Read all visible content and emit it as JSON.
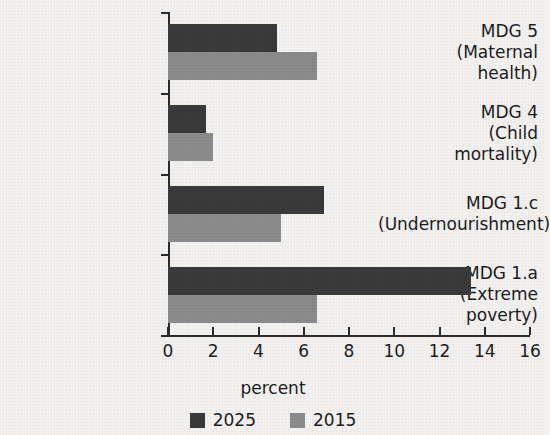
{
  "chart_data": {
    "type": "bar",
    "orientation": "horizontal",
    "title": "",
    "xlabel": "percent",
    "ylabel": "",
    "xlim": [
      0,
      16
    ],
    "xticks": [
      0,
      2,
      4,
      6,
      8,
      10,
      12,
      14,
      16
    ],
    "xtick_labels": [
      "0",
      "2",
      "4",
      "6",
      "8",
      "10",
      "12",
      "14",
      "16"
    ],
    "grid": false,
    "legend_position": "bottom",
    "categories": [
      "MDG 5\n(Maternal\nhealth)",
      "MDG 4\n(Child\nmortality)",
      "MDG 1.c\n(Undernourishment)",
      "MDG 1.a\n(Extreme\npoverty)"
    ],
    "category_lines": [
      [
        "MDG 5",
        "(Maternal",
        "health)"
      ],
      [
        "MDG 4",
        "(Child",
        "mortality)"
      ],
      [
        "MDG 1.c",
        "(Undernourishment)"
      ],
      [
        "MDG 1.a",
        "(Extreme",
        "poverty)"
      ]
    ],
    "series": [
      {
        "name": "2025",
        "color": "#3a3a3a",
        "values": [
          4.8,
          1.7,
          6.9,
          13.4
        ]
      },
      {
        "name": "2015",
        "color": "#8c8c8c",
        "values": [
          6.6,
          2.0,
          5.0,
          6.6
        ]
      }
    ]
  },
  "legend": {
    "entries": [
      {
        "label": "2025",
        "color": "#3a3a3a"
      },
      {
        "label": "2015",
        "color": "#8c8c8c"
      }
    ]
  },
  "axis": {
    "x_title": "percent"
  },
  "colors": {
    "background": "#f3f2f0",
    "axis": "#2b2b2b",
    "text": "#1c1c1c",
    "series_2025": "#3a3a3a",
    "series_2015": "#8c8c8c"
  }
}
